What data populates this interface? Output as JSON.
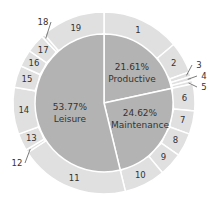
{
  "chart_data": {
    "type": "sunburst",
    "title": "",
    "center": [
      104,
      103
    ],
    "inner_radius": 70,
    "outer_radius": 91,
    "colors": {
      "inner": "#b3b3b3",
      "outer": "#e0e0e0",
      "stroke": "#ffffff",
      "text": "#333333"
    },
    "inner": [
      {
        "label": "Productive",
        "percent_label": "21.61%",
        "value": 21.61,
        "start": 0,
        "end": 77.8,
        "label_pos": [
          132,
          70
        ]
      },
      {
        "label": "Maintenance",
        "percent_label": "24.62%",
        "value": 24.62,
        "start": 77.8,
        "end": 166.4,
        "label_pos": [
          140,
          116
        ]
      },
      {
        "label": "Leisure",
        "percent_label": "53.77%",
        "value": 53.77,
        "start": 166.4,
        "end": 360,
        "label_pos": [
          70,
          110
        ]
      }
    ],
    "outer": [
      {
        "label": "1",
        "parent": "Productive",
        "start": 0,
        "end": 50
      },
      {
        "label": "2",
        "parent": "Productive",
        "start": 50,
        "end": 70
      },
      {
        "label": "3",
        "parent": "Productive",
        "start": 70,
        "end": 73,
        "callout": [
          199,
          68
        ]
      },
      {
        "label": "4",
        "parent": "Productive",
        "start": 73,
        "end": 75.5,
        "callout": [
          204,
          79
        ]
      },
      {
        "label": "5",
        "parent": "Productive",
        "start": 75.5,
        "end": 77.8,
        "callout": [
          204,
          90
        ]
      },
      {
        "label": "6",
        "parent": "Maintenance",
        "start": 77.8,
        "end": 95
      },
      {
        "label": "7",
        "parent": "Maintenance",
        "start": 95,
        "end": 110
      },
      {
        "label": "8",
        "parent": "Maintenance",
        "start": 110,
        "end": 125
      },
      {
        "label": "9",
        "parent": "Maintenance",
        "start": 125,
        "end": 140
      },
      {
        "label": "10",
        "parent": "Maintenance",
        "start": 140,
        "end": 166.4
      },
      {
        "label": "11",
        "parent": "Leisure",
        "start": 166.4,
        "end": 237
      },
      {
        "label": "12",
        "parent": "Leisure",
        "start": 237,
        "end": 239,
        "callout": [
          17,
          166
        ]
      },
      {
        "label": "13",
        "parent": "Leisure",
        "start": 239,
        "end": 250
      },
      {
        "label": "14",
        "parent": "Leisure",
        "start": 250,
        "end": 280
      },
      {
        "label": "15",
        "parent": "Leisure",
        "start": 280,
        "end": 294
      },
      {
        "label": "16",
        "parent": "Leisure",
        "start": 294,
        "end": 305
      },
      {
        "label": "17",
        "parent": "Leisure",
        "start": 305,
        "end": 317
      },
      {
        "label": "18",
        "parent": "Leisure",
        "start": 317,
        "end": 319,
        "callout": [
          43,
          25
        ]
      },
      {
        "label": "19",
        "parent": "Leisure",
        "start": 319,
        "end": 360
      }
    ]
  }
}
